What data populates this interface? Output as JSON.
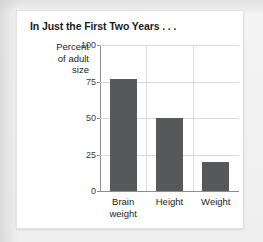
{
  "figure": {
    "title": "In Just the First Two Years . . ."
  },
  "colors": {
    "bar": "#565859",
    "page_background": "#f1f1f1",
    "card_background": "#ffffff",
    "gridline": "#d7d7d7",
    "axis": "#8d8d8d",
    "text": "#1d1d1d"
  },
  "axis_title": {
    "line1": "Percent",
    "line2": "of adult",
    "line3": "size"
  },
  "ticks": [
    {
      "label": "100",
      "value": 100
    },
    {
      "label": "75",
      "value": 75
    },
    {
      "label": "50",
      "value": 50
    },
    {
      "label": "25",
      "value": 25
    },
    {
      "label": "0",
      "value": 0
    }
  ],
  "categories": [
    {
      "line1": "Brain",
      "line2": "weight"
    },
    {
      "line1": "Height",
      "line2": ""
    },
    {
      "line1": "Weight",
      "line2": ""
    }
  ],
  "chart_data": {
    "type": "bar",
    "title": "In Just the First Two Years . . .",
    "categories": [
      "Brain weight",
      "Height",
      "Weight"
    ],
    "values": [
      77,
      50,
      20
    ],
    "xlabel": "",
    "ylabel": "Percent of adult size",
    "ylim": [
      0,
      100
    ],
    "yticks": [
      0,
      25,
      50,
      75,
      100
    ],
    "grid": true,
    "legend": false,
    "series": [
      {
        "name": "Percent of adult size",
        "values": [
          77,
          50,
          20
        ]
      }
    ]
  }
}
